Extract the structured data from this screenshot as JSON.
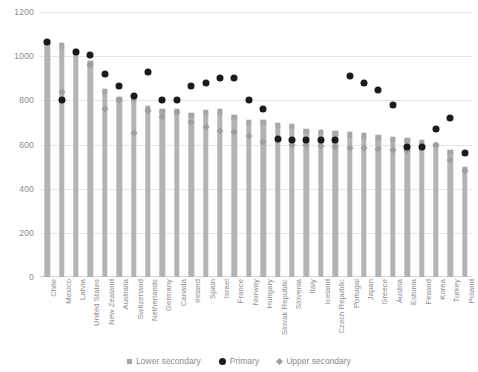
{
  "chart_data": {
    "type": "bar",
    "title": "",
    "xlabel": "",
    "ylabel": "",
    "ylim": [
      0,
      1200
    ],
    "yticks": [
      0,
      200,
      400,
      600,
      800,
      1000,
      1200
    ],
    "grid": true,
    "legend_position": "bottom",
    "categories": [
      "Chile",
      "Mexico",
      "Latvia",
      "United States",
      "New Zealand",
      "Australia",
      "Switzerland",
      "Netherlands",
      "Germany",
      "Canada",
      "Ireland",
      "Spain",
      "Israel",
      "France",
      "Norway",
      "Hungary",
      "Slovak Republic",
      "Slovenia",
      "Italy",
      "Iceland",
      "Czech Republic",
      "Portugal",
      "Japan",
      "Greece",
      "Austria",
      "Estonia",
      "Finland",
      "Korea",
      "Turkey",
      "Poland"
    ],
    "series": [
      {
        "name": "Lower secondary",
        "marker": "square",
        "color": "#a6a6a6",
        "values": [
          1064,
          1047,
          1020,
          969,
          841,
          805,
          805,
          765,
          750,
          748,
          733,
          745,
          748,
          725,
          700,
          702,
          688,
          682,
          660,
          655,
          650,
          645,
          640,
          630,
          624,
          620,
          610,
          596,
          566,
          487
        ]
      },
      {
        "name": "Primary",
        "marker": "circle",
        "color": "#1a1a1a",
        "values": [
          1064,
          800,
          1020,
          1005,
          920,
          863,
          820,
          928,
          800,
          800,
          866,
          880,
          900,
          900,
          800,
          760,
          625,
          620,
          620,
          620,
          621,
          912,
          878,
          845,
          780,
          590,
          590,
          670,
          722,
          562
        ]
      },
      {
        "name": "Upper secondary",
        "marker": "diamond",
        "color": "#9e9e9e",
        "values": [
          1064,
          838,
          1020,
          962,
          760,
          800,
          650,
          753,
          725,
          745,
          700,
          680,
          660,
          655,
          640,
          610,
          620,
          600,
          600,
          595,
          590,
          585,
          582,
          578,
          575,
          570,
          590,
          600,
          530,
          478
        ]
      }
    ]
  },
  "legend": {
    "items": [
      {
        "label": "Lower secondary",
        "marker": "square-marker-icon"
      },
      {
        "label": "Primary",
        "marker": "circle-marker-icon"
      },
      {
        "label": "Upper secondary",
        "marker": "diamond-marker-icon"
      }
    ]
  }
}
